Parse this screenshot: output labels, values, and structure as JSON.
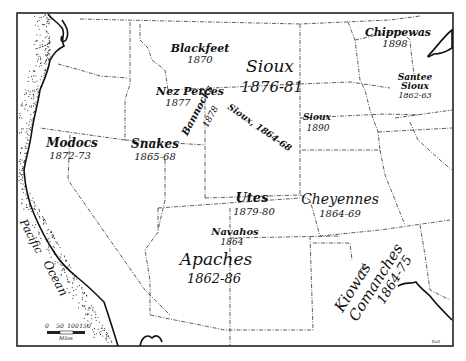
{
  "map": {
    "ocean_label": "Pacific Ocean",
    "tribes": [
      {
        "name": "Blackfeet",
        "years": "1870"
      },
      {
        "name": "Sioux",
        "years": "1876-81"
      },
      {
        "name": "Chippewas",
        "years": "1898"
      },
      {
        "name": "Santee Sioux",
        "years": "1862-63"
      },
      {
        "name": "Nez Perces",
        "years": "1877"
      },
      {
        "name": "Bannocks",
        "years": "1878"
      },
      {
        "name": "Sioux",
        "years": "1864-68"
      },
      {
        "name": "Sioux",
        "years": "1890"
      },
      {
        "name": "Modocs",
        "years": "1872-73"
      },
      {
        "name": "Snakes",
        "years": "1865-68"
      },
      {
        "name": "Utes",
        "years": "1879-80"
      },
      {
        "name": "Cheyennes",
        "years": "1864-69"
      },
      {
        "name": "Navahos",
        "years": "1864"
      },
      {
        "name": "Apaches",
        "years": "1862-86"
      },
      {
        "name": "Kiowas and Comanches",
        "years": "1864-75"
      }
    ],
    "labels": {
      "blackfeet": "Blackfeet",
      "blackfeet_years": "1870",
      "sioux_main": "Sioux",
      "sioux_main_years": "1876-81",
      "chippewas": "Chippewas",
      "chippewas_years": "1898",
      "santee_1": "Santee",
      "santee_2": "Sioux",
      "santee_years": "1862-63",
      "nez_perces": "Nez Perces",
      "nez_perces_years": "1877",
      "bannocks": "Bannocks",
      "bannocks_years": "1878",
      "sioux_diag": "Sioux, 1864-68",
      "sioux_1890": "Sioux",
      "sioux_1890_years": "1890",
      "modocs": "Modocs",
      "modocs_years": "1872-73",
      "snakes": "Snakes",
      "snakes_years": "1865-68",
      "utes": "Utes",
      "utes_years": "1879-80",
      "cheyennes": "Cheyennes",
      "cheyennes_years": "1864-69",
      "navahos": "Navahos",
      "navahos_years": "1864",
      "apaches": "Apaches",
      "apaches_years": "1862-86",
      "kiowas": "Kiowas",
      "and": "and",
      "comanches": "Comanches",
      "kc_years": "1864-75",
      "pacific": "Pacific",
      "ocean": "Ocean"
    },
    "scale": {
      "ticks": [
        "0",
        "50",
        "100",
        "150"
      ],
      "unit": "Miles"
    },
    "signature": "Dall"
  }
}
